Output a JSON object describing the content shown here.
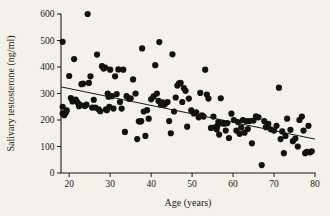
{
  "figure": {
    "background_color": "#f3f1ea",
    "ink_color": "#1a1a18",
    "point_color": "#111110",
    "width": 330,
    "height": 216
  },
  "chart_data": {
    "type": "scatter",
    "title": "",
    "subtitle": "",
    "xlabel": "Age (years)",
    "ylabel": "Salivary testosterone (ng/ml)",
    "xlim": [
      18,
      80
    ],
    "ylim": [
      0,
      600
    ],
    "xticks": [
      20,
      30,
      40,
      50,
      60,
      70,
      80
    ],
    "xticklabels": [
      "20",
      "30",
      "40",
      "50",
      "60",
      "70",
      "80"
    ],
    "yticks": [
      0,
      100,
      200,
      300,
      400,
      500,
      600
    ],
    "yticklabels": [
      "0",
      "100",
      "200",
      "300",
      "400",
      "500",
      "600"
    ],
    "grid": false,
    "legend": false,
    "legend_position": "none",
    "marker": "filled-circle",
    "marker_size": 3.1,
    "series": [
      {
        "name": "Salivary testosterone by age",
        "x": [
          18.4,
          18.4,
          18.4,
          18.8,
          19.2,
          19.4,
          20.0,
          20.4,
          20.8,
          21.2,
          21.6,
          22.0,
          22.4,
          22.6,
          23.0,
          23.4,
          23.8,
          24.2,
          24.5,
          24.8,
          25.2,
          25.6,
          26.0,
          26.4,
          26.8,
          27.2,
          27.6,
          28.0,
          28.4,
          28.8,
          29.0,
          29.2,
          29.4,
          29.6,
          29.8,
          30.0,
          30.4,
          30.8,
          31.2,
          31.6,
          32.0,
          32.4,
          32.8,
          33.2,
          33.6,
          34.0,
          34.6,
          35.0,
          35.6,
          36.2,
          36.6,
          37.0,
          37.4,
          37.6,
          37.8,
          38.2,
          38.6,
          39.0,
          39.4,
          40.0,
          40.6,
          41.0,
          41.4,
          41.8,
          42.0,
          42.4,
          42.8,
          43.2,
          43.6,
          44.0,
          44.4,
          44.8,
          45.2,
          45.6,
          46.0,
          46.4,
          46.8,
          47.2,
          47.6,
          48.0,
          48.4,
          48.8,
          49.2,
          49.8,
          50.4,
          51.0,
          51.6,
          52.0,
          52.4,
          52.8,
          53.2,
          53.6,
          54.0,
          54.6,
          55.2,
          55.6,
          56.0,
          56.2,
          56.4,
          56.6,
          57.0,
          57.4,
          57.8,
          58.2,
          58.6,
          59.0,
          59.6,
          60.2,
          60.8,
          61.2,
          61.6,
          62.0,
          62.4,
          62.8,
          63.2,
          63.6,
          64.0,
          64.6,
          65.0,
          65.6,
          66.2,
          67.0,
          67.6,
          68.0,
          68.6,
          69.2,
          70.0,
          70.6,
          71.2,
          71.6,
          72.0,
          72.4,
          72.8,
          73.2,
          74.0,
          74.6,
          75.2,
          75.8,
          76.2,
          76.8,
          77.2,
          77.6,
          78.0,
          78.4,
          78.8,
          79.2
        ],
        "y": [
          495,
          250,
          225,
          218,
          228,
          236,
          366,
          283,
          270,
          430,
          277,
          267,
          252,
          258,
          335,
          337,
          253,
          258,
          600,
          340,
          365,
          247,
          276,
          247,
          447,
          240,
          233,
          403,
          394,
          398,
          240,
          237,
          300,
          288,
          250,
          390,
          290,
          243,
          365,
          298,
          391,
          268,
          243,
          390,
          155,
          290,
          280,
          282,
          353,
          300,
          128,
          195,
          194,
          196,
          470,
          232,
          140,
          237,
          205,
          278,
          289,
          407,
          300,
          272,
          494,
          258,
          267,
          258,
          264,
          268,
          196,
          150,
          448,
          232,
          285,
          330,
          338,
          340,
          268,
          320,
          310,
          175,
          281,
          236,
          225,
          229,
          210,
          302,
          218,
          213,
          390,
          296,
          281,
          170,
          213,
          172,
          165,
          178,
          192,
          145,
          282,
          188,
          186,
          160,
          188,
          132,
          224,
          200,
          160,
          192,
          148,
          172,
          200,
          152,
          196,
          166,
          196,
          112,
          198,
          214,
          210,
          30,
          196,
          173,
          185,
          165,
          160,
          178,
          322,
          128,
          157,
          75,
          140,
          205,
          163,
          120,
          130,
          100,
          200,
          213,
          160,
          75,
          80,
          178,
          78,
          82
        ]
      }
    ],
    "trend_line": {
      "label": "fitted regression line",
      "x_start": 18,
      "y_start": 325,
      "x_end": 80,
      "y_end": 128
    }
  }
}
